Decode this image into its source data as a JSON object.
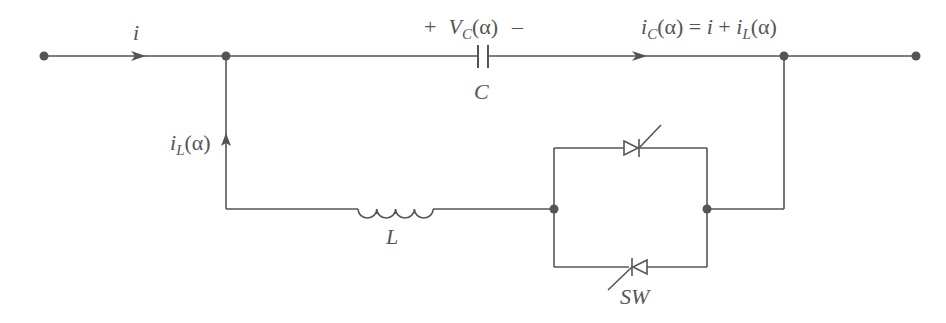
{
  "diagram": {
    "type": "circuit",
    "colors": {
      "stroke": "#555555",
      "background": "#ffffff"
    },
    "labels": {
      "input_current": {
        "main": "i"
      },
      "capacitor_voltage": {
        "plus": "+",
        "main": "V",
        "sub": "C",
        "arg": "(α)",
        "minus": "–"
      },
      "capacitor": {
        "main": "C"
      },
      "capacitor_current": {
        "main": "i",
        "sub": "C",
        "arg": "(α) = ",
        "i": "i",
        "plus": " + ",
        "i2": "i",
        "sub2": "L",
        "arg2": "(α)"
      },
      "inductor_current": {
        "main": "i",
        "sub": "L",
        "arg": "(α)"
      },
      "inductor": {
        "main": "L"
      },
      "switch": {
        "main": "SW"
      }
    },
    "components": [
      {
        "id": "C",
        "type": "capacitor",
        "branch": "top"
      },
      {
        "id": "L",
        "type": "inductor",
        "branch": "bottom"
      },
      {
        "id": "SW",
        "type": "anti-parallel thyristor pair",
        "branch": "bottom"
      }
    ],
    "nodes": [
      "left-terminal",
      "left-junction",
      "right-junction",
      "right-terminal",
      "switch-left-node",
      "switch-right-node"
    ]
  }
}
